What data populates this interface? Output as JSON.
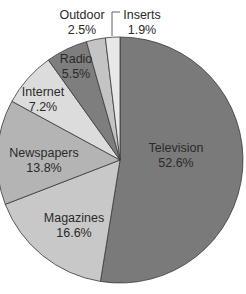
{
  "chart_data": {
    "type": "pie",
    "title": "",
    "start_angle_deg": 0,
    "direction": "clockwise",
    "slices": [
      {
        "label": "Television",
        "value": 52.6,
        "display": "52.6%",
        "color": "#7a7a7a"
      },
      {
        "label": "Magazines",
        "value": 16.6,
        "display": "16.6%",
        "color": "#c8c8c8"
      },
      {
        "label": "Newspapers",
        "value": 13.8,
        "display": "13.8%",
        "color": "#b4b4b4"
      },
      {
        "label": "Internet",
        "value": 7.2,
        "display": "7.2%",
        "color": "#dcdcdc"
      },
      {
        "label": "Radio",
        "value": 5.5,
        "display": "5.5%",
        "color": "#7e7e7e"
      },
      {
        "label": "Outdoor",
        "value": 2.5,
        "display": "2.5%",
        "color": "#c4c4c4"
      },
      {
        "label": "Inserts",
        "value": 1.9,
        "display": "1.9%",
        "color": "#e8e8e8"
      }
    ],
    "legend": "none (direct labels)"
  },
  "labels": [
    {
      "name": "Television",
      "pct": "52.6%",
      "x": 176,
      "y": 141
    },
    {
      "name": "Magazines",
      "pct": "16.6%",
      "x": 74,
      "y": 211
    },
    {
      "name": "Newspapers",
      "pct": "13.8%",
      "x": 44,
      "y": 146
    },
    {
      "name": "Internet",
      "pct": "7.2%",
      "x": 43,
      "y": 85
    },
    {
      "name": "Radio",
      "pct": "5.5%",
      "x": 76,
      "y": 52
    },
    {
      "name": "Outdoor",
      "pct": "2.5%",
      "x": 82,
      "y": 8
    },
    {
      "name": "Inserts",
      "pct": "1.9%",
      "x": 142,
      "y": 8
    }
  ]
}
